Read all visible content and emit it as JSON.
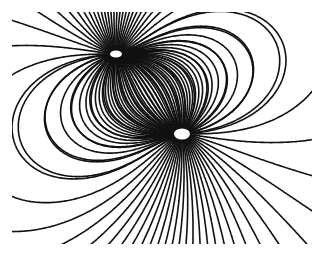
{
  "image": {
    "subject": "Electric field lines of two point charges (dipole) visualized with grass seeds",
    "description": "Black-and-white photograph of curved field lines radiating from two bright charges",
    "frame": {
      "x": 12,
      "y": 12,
      "width": 300,
      "height": 232
    },
    "colors": {
      "background": "#ffffff",
      "lines": "#111111",
      "charge": "#ffffff"
    },
    "charges": [
      {
        "name": "upper-charge",
        "x": 104,
        "y": 42,
        "q": 1,
        "rx": 6,
        "ry": 3.5
      },
      {
        "name": "lower-charge",
        "x": 170,
        "y": 122,
        "q": -1,
        "rx": 8,
        "ry": 5.5
      }
    ],
    "line_count": 64
  }
}
